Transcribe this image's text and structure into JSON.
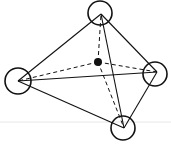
{
  "diagram": {
    "colors": {
      "stroke": "#111111",
      "background": "#ffffff",
      "baseline": "#e6e6e6"
    },
    "center": {
      "x": 98,
      "y": 62,
      "r": 4
    },
    "vertices": [
      {
        "id": "top",
        "x": 101,
        "y": 14,
        "cx": 100,
        "cy": 13,
        "r": 12
      },
      {
        "id": "left",
        "x": 18,
        "y": 81,
        "cx": 18,
        "cy": 81,
        "r": 13
      },
      {
        "id": "right",
        "x": 157,
        "y": 72,
        "cx": 155,
        "cy": 74,
        "r": 12
      },
      {
        "id": "bottom",
        "x": 124,
        "y": 128,
        "cx": 123,
        "cy": 128,
        "r": 12
      }
    ],
    "solid_edges": [
      [
        "top",
        "left"
      ],
      [
        "top",
        "right"
      ],
      [
        "top",
        "bottom"
      ],
      [
        "left",
        "right"
      ],
      [
        "left",
        "bottom"
      ],
      [
        "right",
        "bottom"
      ]
    ],
    "dashed_edges": [
      [
        "center",
        "top"
      ],
      [
        "center",
        "left"
      ],
      [
        "center",
        "right"
      ],
      [
        "center",
        "bottom"
      ]
    ]
  }
}
